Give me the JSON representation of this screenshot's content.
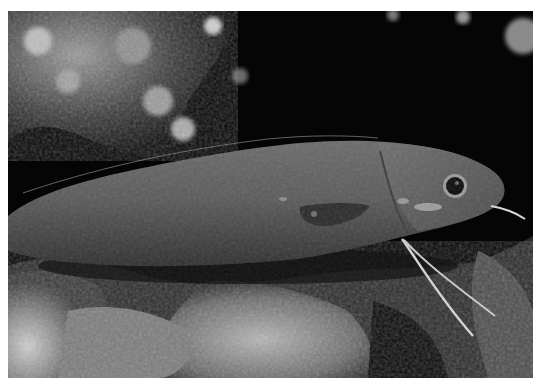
{
  "image": {
    "alt": "Grayscale underwater photograph of an elongated fish with long thin barbel fins resting on a rocky reef",
    "subject": "fish",
    "palette": {
      "background": "#050505",
      "reef_light": "#c8c8c8",
      "reef_mid": "#7a7a7a",
      "fish_body": "#5e5e5e",
      "fish_belly": "#3a3a3a",
      "eye": "#0a0a0a",
      "barbel": "#d8d8d8",
      "border": "#ffffff"
    }
  }
}
